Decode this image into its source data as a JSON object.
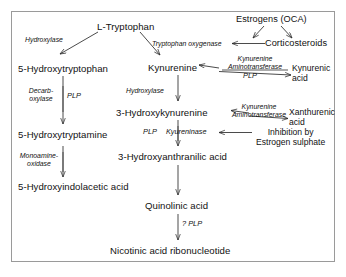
{
  "diagram": {
    "frame_color": "#9a9a9a",
    "text_color": "#111111",
    "background": "#ffffff"
  },
  "metabolites": {
    "l_tryptophan": "L-Tryptophan",
    "hydroxytryptophan": "5-Hydroxytryptophan",
    "kynurenine": "Kynurenine",
    "kynurenic_acid_l1": "Kynurenic",
    "kynurenic_acid_l2": "acid",
    "hydroxytryptamine": "5-Hydroxytryptamine",
    "hydroxykynurenine": "3-Hydroxykynurenine",
    "xanthurenic_acid_l1": "Xanthurenic",
    "xanthurenic_acid_l2": "acid",
    "hydroxyindolacetic_acid": "5-Hydroxyindolacetic acid",
    "hydroxyanthranilic_acid": "3-Hydroxyanthranilic acid",
    "quinolinic_acid": "Quinolinic acid",
    "nicotinic_acid_ribonucleotide": "Nicotinic acid ribonucleotide"
  },
  "modulators": {
    "estrogens": "Estrogens (OCA)",
    "corticosteroids": "Corticosteroids",
    "inhibition_l1": "Inhibition by",
    "inhibition_l2": "Estrogen sulphate"
  },
  "enzymes": {
    "hydroxylase_top": "Hydroxylase",
    "tryptophan_oxygenase": "Tryptophan oxygenase",
    "kynurenine_aminotransferase_1_l1": "Kynurenine",
    "kynurenine_aminotransferase_1_l2": "Aminotransferase",
    "decarboxylase_l1": "Decarb-",
    "decarboxylase_l2": "oxylase",
    "hydroxylase_mid": "Hydroxylase",
    "kynurenine_aminotransferase_2_l1": "Kynurenine",
    "kynurenine_aminotransferase_2_l2": "Aminotransferase",
    "monoamine_oxidase_l1": "Monoamine-",
    "monoamine_oxidase_l2": "oxidase",
    "kyureninase": "Kyureninase"
  },
  "cofactors": {
    "plp_kat1": "PLP",
    "plp_decarboxylase": "PLP",
    "plp_kyureninase": "PLP",
    "plp_quinolinic": "? PLP"
  }
}
